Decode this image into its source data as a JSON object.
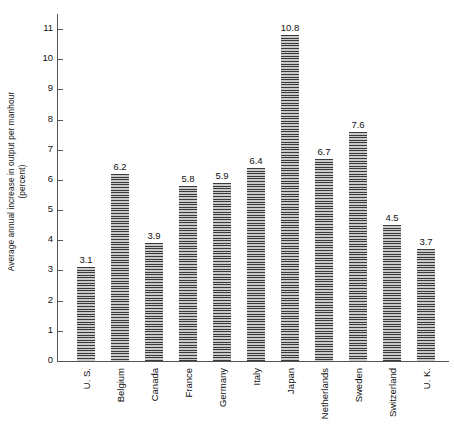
{
  "chart_data": {
    "type": "bar",
    "title": "",
    "xlabel": "",
    "ylabel": "Average annual increase in output per manhour (percent)",
    "ylabel_line1": "Average annual increase in output per manhour",
    "ylabel_line2": "(percent)",
    "ylim": [
      0,
      11.5
    ],
    "yticks": [
      0,
      1,
      2,
      3,
      4,
      5,
      6,
      7,
      8,
      9,
      10,
      11
    ],
    "ytick_labels": [
      "0",
      "1",
      "2",
      "3",
      "4",
      "5",
      "6",
      "7",
      "8",
      "9",
      "10",
      "11"
    ],
    "grid": false,
    "legend": "none",
    "categories": [
      "U. S.",
      "Belgium",
      "Canada",
      "France",
      "Germany",
      "Italy",
      "Japan",
      "Netherlands",
      "Sweden",
      "Switzerland",
      "U. K."
    ],
    "values": [
      3.1,
      6.2,
      3.9,
      5.8,
      5.9,
      6.4,
      10.8,
      6.7,
      7.6,
      4.5,
      3.7
    ],
    "value_labels": [
      "3.1",
      "6.2",
      "3.9",
      "5.8",
      "5.9",
      "6.4",
      "10.8",
      "6.7",
      "7.6",
      "4.5",
      "3.7"
    ],
    "bar_fill": "horizontal-hatch",
    "bar_color": "#8c8c8c",
    "axis_color": "#555555"
  }
}
